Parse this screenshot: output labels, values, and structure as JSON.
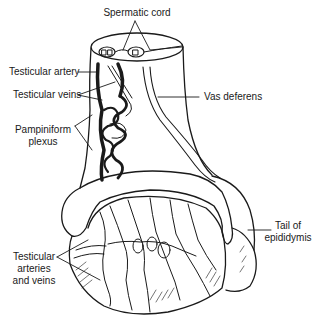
{
  "diagram": {
    "labels": [
      {
        "id": "spermatic-cord",
        "text": "Spermatic cord"
      },
      {
        "id": "testicular-artery",
        "text": "Testicular artery"
      },
      {
        "id": "testicular-veins",
        "text": "Testicular veins"
      },
      {
        "id": "vas-deferens",
        "text": "Vas deferens"
      },
      {
        "id": "pampiniform-plexus",
        "lines": [
          "Pampiniform",
          "plexus"
        ]
      },
      {
        "id": "tail-of-epididymis",
        "lines": [
          "Tail of",
          "epididymis"
        ]
      },
      {
        "id": "testicular-arteries-veins",
        "lines": [
          "Testicular",
          "arteries",
          "and veins"
        ]
      }
    ],
    "colors": {
      "ink": "#1a1a1a",
      "background": "#ffffff"
    }
  }
}
